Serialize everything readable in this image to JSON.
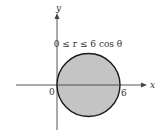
{
  "figure": {
    "region_label": "0 ≤ r ≤ 6 cos θ",
    "axes": {
      "x_label": "x",
      "y_label": "y",
      "origin_label": "0",
      "x_tick_label": "6"
    },
    "colors": {
      "fill": "#c4c4c4",
      "stroke": "#1a1a1a",
      "axis": "#444444"
    }
  }
}
